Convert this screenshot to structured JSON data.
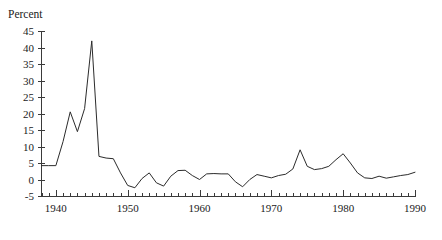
{
  "chart_data": {
    "type": "line",
    "title": "",
    "subtitle": "",
    "xlabel": "",
    "ylabel": "Percent",
    "ylim": [
      -5,
      45
    ],
    "xlim": [
      1938,
      1990
    ],
    "ytick_step": 5,
    "xtick_step": 1,
    "grid": false,
    "legend": "none",
    "line_color": "#2b2b2b",
    "axis_color": "#3a3a3a",
    "ytick_labels": [
      "45",
      "40",
      "35",
      "30",
      "25",
      "20",
      "15",
      "10",
      "5",
      "0",
      "-5"
    ],
    "ytick_values": [
      45,
      40,
      35,
      30,
      25,
      20,
      15,
      10,
      5,
      0,
      -5
    ],
    "xtick_labels": [
      "1940",
      "1950",
      "1960",
      "1970",
      "1980",
      "1990"
    ],
    "xtick_values": [
      1940,
      1950,
      1960,
      1970,
      1980,
      1990
    ],
    "series": [
      {
        "name": "Percent",
        "x": [
          1938,
          1939,
          1940,
          1941,
          1942,
          1943,
          1944,
          1945,
          1946,
          1947,
          1948,
          1949,
          1950,
          1951,
          1952,
          1953,
          1954,
          1955,
          1956,
          1957,
          1958,
          1959,
          1960,
          1961,
          1962,
          1963,
          1964,
          1965,
          1966,
          1967,
          1968,
          1969,
          1970,
          1971,
          1972,
          1973,
          1974,
          1975,
          1976,
          1977,
          1978,
          1979,
          1980,
          1981,
          1982,
          1983,
          1984,
          1985,
          1986,
          1987,
          1988,
          1989,
          1990
        ],
        "values": [
          4.2,
          4.2,
          4.2,
          11.5,
          20.5,
          14.5,
          21.5,
          42.0,
          7.0,
          6.5,
          6.3,
          2.0,
          -1.8,
          -2.5,
          0.3,
          2.0,
          -1.0,
          -2.0,
          1.0,
          2.7,
          2.8,
          1.2,
          0.0,
          1.7,
          1.8,
          1.7,
          1.7,
          -0.7,
          -2.2,
          0.0,
          1.5,
          1.0,
          0.5,
          1.2,
          1.6,
          3.2,
          9.0,
          4.0,
          3.0,
          3.3,
          4.0,
          6.0,
          7.8,
          5.0,
          2.0,
          0.5,
          0.3,
          1.0,
          0.4,
          0.8,
          1.2,
          1.5,
          2.2
        ]
      }
    ]
  }
}
